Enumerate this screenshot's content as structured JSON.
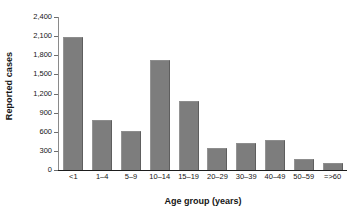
{
  "chart_data": {
    "type": "bar",
    "title": "",
    "subtitle": "",
    "xlabel": "Age group (years)",
    "ylabel": "Reported cases",
    "categories": [
      "<1",
      "1–4",
      "5–9",
      "10–14",
      "15–19",
      "20–29",
      "30–39",
      "40–49",
      "50–59",
      "=>60"
    ],
    "values": [
      2090,
      790,
      615,
      1720,
      1080,
      340,
      420,
      465,
      170,
      110
    ],
    "series": [
      {
        "name": "Reported cases",
        "values": [
          2090,
          790,
          615,
          1720,
          1080,
          340,
          420,
          465,
          170,
          110
        ]
      }
    ],
    "ylim": [
      0,
      2400
    ],
    "ytick_values": [
      0,
      300,
      600,
      900,
      1200,
      1500,
      1800,
      2100,
      2400
    ],
    "ytick_labels": [
      "0",
      "300",
      "600",
      "900",
      "1,200",
      "1,500",
      "1,800",
      "2,100",
      "2,400"
    ],
    "grid": false,
    "legend": false,
    "legend_position": "none",
    "bar_color": "#7d7d7d",
    "axis_color": "#1d1d1d",
    "text_color": "#151515",
    "background": "#ffffff"
  }
}
